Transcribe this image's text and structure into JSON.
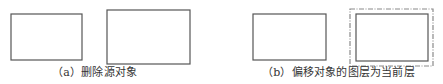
{
  "colors": {
    "background": "#ffffff",
    "stroke": "#555555",
    "dashed_stroke": "#8a8a8a",
    "text": "#333333"
  },
  "panels": [
    {
      "id": "a",
      "caption": "（a）删除源对象",
      "shapes": [
        {
          "type": "rect",
          "style": "solid",
          "x": 11,
          "y": 14,
          "w": 71,
          "h": 46
        },
        {
          "type": "rect",
          "style": "solid",
          "x": 107,
          "y": 10,
          "w": 83,
          "h": 54
        }
      ]
    },
    {
      "id": "b",
      "caption": "（b）偏移对象的图层为当前层",
      "shapes": [
        {
          "type": "rect",
          "style": "solid",
          "x": 253,
          "y": 14,
          "w": 73,
          "h": 46
        },
        {
          "type": "rect",
          "style": "dash-dot",
          "x": 350,
          "y": 9,
          "w": 83,
          "h": 57
        },
        {
          "type": "rect",
          "style": "solid",
          "x": 356,
          "y": 14,
          "w": 72,
          "h": 47
        }
      ]
    }
  ]
}
